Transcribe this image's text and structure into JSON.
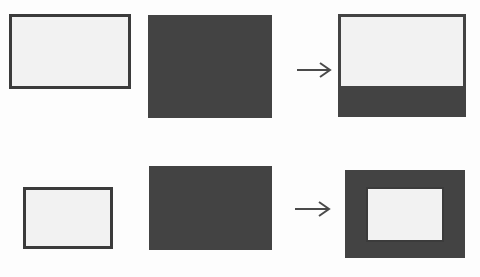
{
  "figure": {
    "background_color": "#fdfdfd",
    "dark_color": "#434343",
    "light_color": "#f2f2f2",
    "border_color": "#3b3b3b",
    "arrow_color": "#4a4a4a",
    "width": 480,
    "height": 277
  },
  "rows": [
    {
      "id": "row-1",
      "source_light": {
        "label": "",
        "shape": "wide-light-rectangle",
        "x": 9,
        "y": 14,
        "width": 122,
        "height": 75,
        "fill": "#f2f2f2",
        "stroke": "#3b3b3b"
      },
      "source_dark": {
        "label": "",
        "shape": "dark-rectangle",
        "x": 148,
        "y": 15,
        "width": 124,
        "height": 103,
        "fill": "#434343"
      },
      "operator": {
        "label": "",
        "icon": "arrow-right-icon"
      },
      "result": {
        "label": "",
        "shape": "composite-top-aligned",
        "x": 338,
        "y": 14,
        "width": 128,
        "height": 103,
        "outer_fill": "#434343",
        "inner_fill": "#f2f2f2",
        "inner_x": 341,
        "inner_y": 17,
        "inner_width": 122,
        "inner_height": 69
      }
    },
    {
      "id": "row-2",
      "source_light": {
        "label": "",
        "shape": "square-light-rectangle",
        "x": 23,
        "y": 187,
        "width": 90,
        "height": 62,
        "fill": "#f2f2f2",
        "stroke": "#3b3b3b"
      },
      "source_dark": {
        "label": "",
        "shape": "dark-rectangle",
        "x": 149,
        "y": 166,
        "width": 123,
        "height": 84,
        "fill": "#434343"
      },
      "operator": {
        "label": "",
        "icon": "arrow-right-icon"
      },
      "result": {
        "label": "",
        "shape": "composite-centered-frame",
        "x": 345,
        "y": 170,
        "width": 120,
        "height": 88,
        "outer_fill": "#434343",
        "inner_fill": "#f2f2f2",
        "inner_x": 366,
        "inner_y": 187,
        "inner_width": 78,
        "inner_height": 55,
        "inner_stroke": "#3b3b3b"
      }
    }
  ]
}
